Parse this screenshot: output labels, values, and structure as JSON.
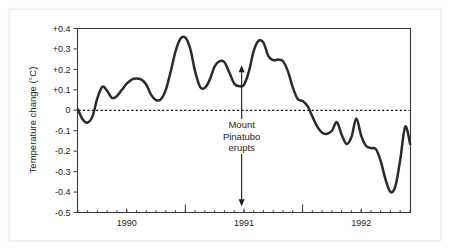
{
  "figure": {
    "background_color": "#ffffff",
    "line_color": "#2b2b2b",
    "axis_color": "#3a3a3a",
    "text_color": "#1c1c1c"
  },
  "chart_data": {
    "type": "line",
    "title": "",
    "subtitle": "",
    "xlabel": "",
    "ylabel": "Temperature change (°C)",
    "ylim": [
      -0.5,
      0.4
    ],
    "xlim": [
      1989.58,
      1992.42
    ],
    "grid": false,
    "legend": null,
    "y_ticks": [
      0.4,
      0.3,
      0.2,
      0.1,
      0.0,
      -0.1,
      -0.2,
      -0.3,
      -0.4,
      -0.5
    ],
    "y_tick_labels": [
      "+0.4",
      "+0.3",
      "+0.2",
      "+0.1",
      "0",
      "-0.1",
      "-0.2",
      "-0.3",
      "-0.4",
      "-0.5"
    ],
    "x_ticks": [
      1990.0,
      1991.0,
      1992.0
    ],
    "x_tick_labels": [
      "1990",
      "1991",
      "1992"
    ],
    "x_minor_tick_interval": 0.0833,
    "x_medium_ticks": [
      1990.5,
      1991.5
    ],
    "reference_lines": [
      {
        "name": "zero-line",
        "y": 0.0,
        "style": "dashed"
      }
    ],
    "annotations": [
      {
        "name": "mount-pinatubo-erupts",
        "text_lines": [
          "Mount",
          "Pinatubo",
          "erupts"
        ],
        "x": 1990.98,
        "arrow_top_y": 0.22,
        "arrow_bottom_y": -0.47,
        "arrow_style": "double-headed-vertical"
      }
    ],
    "series": [
      {
        "name": "Global temperature anomaly",
        "x": [
          1989.583,
          1989.625,
          1989.667,
          1989.708,
          1989.75,
          1989.792,
          1989.833,
          1989.875,
          1989.917,
          1989.958,
          1990.0,
          1990.042,
          1990.083,
          1990.125,
          1990.167,
          1990.208,
          1990.25,
          1990.292,
          1990.333,
          1990.375,
          1990.417,
          1990.458,
          1990.5,
          1990.542,
          1990.583,
          1990.625,
          1990.667,
          1990.708,
          1990.75,
          1990.792,
          1990.833,
          1990.875,
          1990.917,
          1990.958,
          1991.0,
          1991.042,
          1991.083,
          1991.125,
          1991.167,
          1991.208,
          1991.25,
          1991.292,
          1991.333,
          1991.375,
          1991.417,
          1991.458,
          1991.5,
          1991.542,
          1991.583,
          1991.625,
          1991.667,
          1991.708,
          1991.75,
          1991.792,
          1991.833,
          1991.875,
          1991.917,
          1991.958,
          1992.0,
          1992.042,
          1992.083,
          1992.125,
          1992.167,
          1992.208,
          1992.25,
          1992.292,
          1992.333,
          1992.375,
          1992.417
        ],
        "y": [
          0.005,
          -0.045,
          -0.06,
          -0.03,
          0.06,
          0.115,
          0.095,
          0.06,
          0.07,
          0.1,
          0.13,
          0.15,
          0.155,
          0.15,
          0.125,
          0.075,
          0.05,
          0.055,
          0.1,
          0.19,
          0.29,
          0.35,
          0.355,
          0.3,
          0.19,
          0.115,
          0.11,
          0.15,
          0.215,
          0.24,
          0.235,
          0.185,
          0.13,
          0.118,
          0.125,
          0.19,
          0.29,
          0.34,
          0.33,
          0.265,
          0.245,
          0.248,
          0.24,
          0.19,
          0.11,
          0.055,
          0.045,
          0.02,
          -0.03,
          -0.08,
          -0.11,
          -0.115,
          -0.1,
          -0.058,
          -0.12,
          -0.165,
          -0.13,
          -0.04,
          -0.125,
          -0.175,
          -0.185,
          -0.19,
          -0.25,
          -0.34,
          -0.4,
          -0.37,
          -0.24,
          -0.08,
          -0.165
        ]
      }
    ]
  }
}
